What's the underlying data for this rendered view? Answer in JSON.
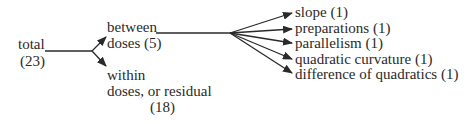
{
  "diagram": {
    "root": {
      "label": "total",
      "df": "(23)"
    },
    "between": {
      "label_line1": "between",
      "label_line2": "doses (5)"
    },
    "within": {
      "label_line1": "within",
      "label_line2": "doses, or residual",
      "label_line3": "(18)"
    },
    "components": [
      {
        "label": "slope (1)"
      },
      {
        "label": "preparations (1)"
      },
      {
        "label": "parallelism (1)"
      },
      {
        "label": "quadratic curvature (1)"
      },
      {
        "label": "difference of quadratics (1)"
      }
    ],
    "colors": {
      "ink": "#2a2a2a",
      "background": "#ffffff"
    }
  }
}
